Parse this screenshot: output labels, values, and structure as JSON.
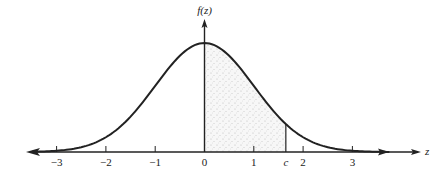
{
  "figure": {
    "type": "normal-distribution-diagram",
    "y_axis_label": "f(z)",
    "x_axis_label": "z",
    "x_ticks": [
      {
        "value": -3,
        "label": "−3"
      },
      {
        "value": -2,
        "label": "−2"
      },
      {
        "value": -1,
        "label": "−1"
      },
      {
        "value": 0,
        "label": "0"
      },
      {
        "value": 1,
        "label": "1"
      },
      {
        "value": 2,
        "label": "2"
      },
      {
        "value": 3,
        "label": "3"
      }
    ],
    "marker": {
      "label": "c",
      "value": 1.65
    },
    "shaded_region": {
      "from": 0,
      "to": "c",
      "description": "area under curve between 0 and c"
    },
    "x_range": [
      -3.6,
      4.4
    ],
    "curve": "standard normal density",
    "colors": {
      "ink": "#222222",
      "shade": "#c8c8c8"
    }
  }
}
